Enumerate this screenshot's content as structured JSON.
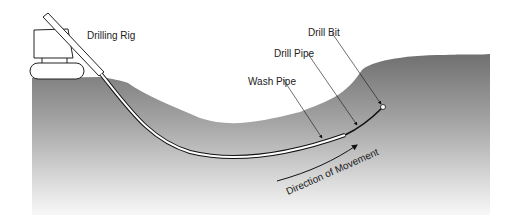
{
  "diagram": {
    "labels": {
      "rig": "Drilling Rig",
      "drill_bit": "Drill Bit",
      "drill_pipe": "Drill Pipe",
      "wash_pipe": "Wash Pipe",
      "direction": "Direction of Movement"
    },
    "colors": {
      "ground_top": "#7a7a7a",
      "ground_bottom": "#f2f2f2",
      "line": "#111111",
      "rig_fill": "#ffffff"
    }
  }
}
